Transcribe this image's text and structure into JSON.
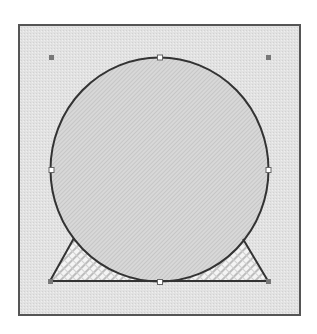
{
  "canvas": {
    "width": 317,
    "height": 334,
    "background": "#ffffff"
  },
  "frame": {
    "x": 19,
    "y": 25,
    "width": 281,
    "height": 290,
    "fill": "#e3e3e3",
    "stroke": "#555555"
  },
  "shapes": {
    "circle": {
      "cx": 159.5,
      "cy": 169.5,
      "rx": 109,
      "ry": 112,
      "fill": "#d6d6d6",
      "stroke": "#333333"
    },
    "triangle": {
      "points": "50,281 74,238 98,262 160,282 222,262 243,239 268,281",
      "fill": "#f2f2f2",
      "stroke": "#333333"
    }
  },
  "handles": {
    "corner": [
      {
        "name": "handle-top-left",
        "x": 51,
        "y": 57
      },
      {
        "name": "handle-top-right",
        "x": 268,
        "y": 57
      },
      {
        "name": "handle-bottom-left",
        "x": 51,
        "y": 281
      },
      {
        "name": "handle-bottom-right",
        "x": 268,
        "y": 281
      }
    ],
    "midpoint": [
      {
        "name": "handle-top",
        "x": 160,
        "y": 57
      },
      {
        "name": "handle-left",
        "x": 51,
        "y": 170
      },
      {
        "name": "handle-right",
        "x": 268,
        "y": 170
      },
      {
        "name": "handle-bottom",
        "x": 160,
        "y": 282
      }
    ],
    "corner_color": "#777777",
    "midpoint_fill": "#ffffff",
    "midpoint_stroke": "#666666"
  }
}
